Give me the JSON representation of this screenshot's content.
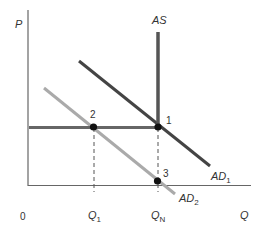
{
  "diagram": {
    "type": "economics-AD-AS",
    "axes": {
      "y_label": "P",
      "x_label": "Q",
      "origin_label": "0"
    },
    "curves": {
      "as": {
        "label": "AS",
        "color": "#555555"
      },
      "ad1": {
        "label": "AD",
        "subscript": "1",
        "color": "#444444"
      },
      "ad2": {
        "label": "AD",
        "subscript": "2",
        "color": "#aaaaaa"
      },
      "price_line": {
        "color": "#666666"
      }
    },
    "points": [
      {
        "label": "1"
      },
      {
        "label": "2"
      },
      {
        "label": "3"
      }
    ],
    "x_ticks": {
      "q1": {
        "label": "Q",
        "subscript": "1"
      },
      "qn": {
        "label": "Q",
        "subscript": "N"
      }
    }
  }
}
